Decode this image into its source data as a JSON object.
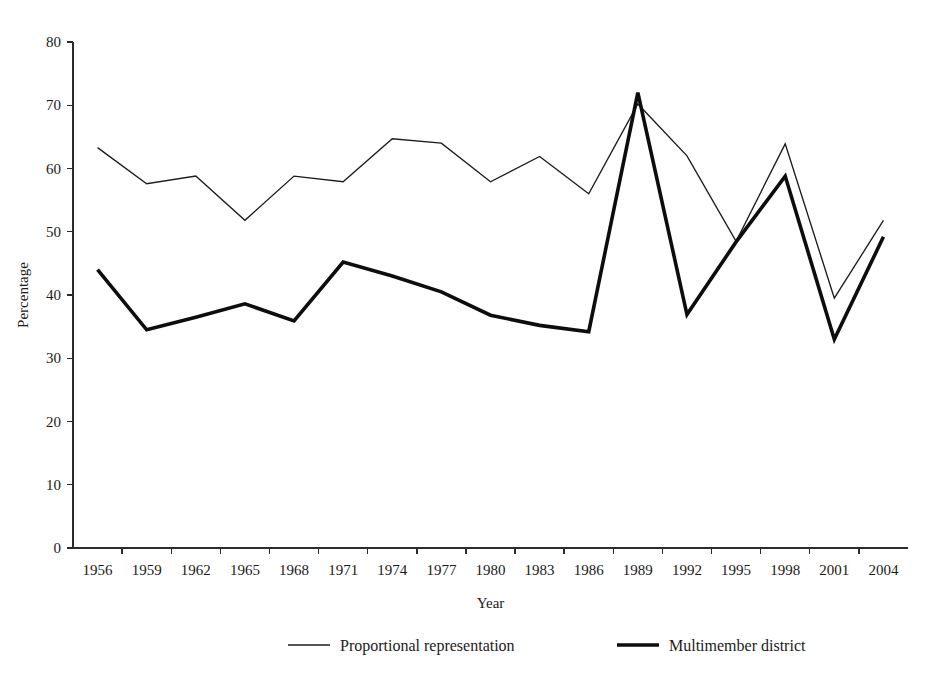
{
  "chart_data": {
    "type": "line",
    "title": "",
    "xlabel": "Year",
    "ylabel": "Percentage",
    "xlim": [
      1956,
      2004
    ],
    "ylim": [
      0,
      80
    ],
    "grid": false,
    "legend_position": "bottom",
    "x": [
      1956,
      1959,
      1962,
      1965,
      1968,
      1971,
      1974,
      1977,
      1980,
      1983,
      1986,
      1989,
      1992,
      1995,
      1998,
      2001,
      2004
    ],
    "xtick_labels": [
      "1956",
      "1959",
      "1962",
      "1965",
      "1968",
      "1971",
      "1974",
      "1977",
      "1980",
      "1983",
      "1986",
      "1989",
      "1992",
      "1995",
      "1998",
      "2001",
      "2004"
    ],
    "ytick_labels": [
      "0",
      "10",
      "20",
      "30",
      "40",
      "50",
      "60",
      "70",
      "80"
    ],
    "ytick_values": [
      0,
      10,
      20,
      30,
      40,
      50,
      60,
      70,
      80
    ],
    "series": [
      {
        "name": "Proportional representation",
        "style": "thin",
        "values": [
          63.3,
          57.6,
          58.8,
          51.8,
          58.8,
          57.9,
          64.7,
          64.0,
          57.9,
          61.9,
          56.0,
          70.2,
          62.0,
          48.5,
          63.9,
          39.5,
          51.8
        ]
      },
      {
        "name": "Multimember district",
        "style": "thick",
        "values": [
          44.0,
          34.5,
          36.5,
          38.6,
          35.9,
          45.2,
          43.0,
          40.5,
          36.8,
          35.2,
          34.2,
          72.0,
          36.9,
          48.4,
          58.8,
          33.0,
          49.2
        ]
      }
    ]
  },
  "legend": {
    "items": [
      {
        "label": "Proportional representation",
        "style": "thin"
      },
      {
        "label": "Multimember district",
        "style": "thick"
      }
    ]
  },
  "axes": {
    "y_title": "Percentage",
    "x_title": "Year"
  }
}
